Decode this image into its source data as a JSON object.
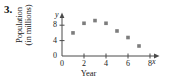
{
  "problem": {
    "number": "3."
  },
  "chart_data": {
    "type": "scatter",
    "title": "",
    "xlabel": "Year",
    "ylabel_line1": "Population",
    "ylabel_line2": "(in millions)",
    "x_axis_variable": "x",
    "y_axis_variable": "y",
    "xlim": [
      0,
      8.6
    ],
    "ylim": [
      0,
      10.4
    ],
    "xticks": [
      0,
      2,
      4,
      6,
      8
    ],
    "xtick_labels": [
      "0",
      "2",
      "4",
      "6",
      "8"
    ],
    "yticks": [
      0,
      4,
      8
    ],
    "ytick_labels": [
      "0",
      "4",
      "8"
    ],
    "grid": false,
    "legend": null,
    "marker": "square",
    "marker_color": "#7d7d7d",
    "x": [
      1,
      2,
      3,
      4,
      5,
      6,
      7
    ],
    "values": [
      6.0,
      8.5,
      9.2,
      8.5,
      6.5,
      4.8,
      2.6
    ],
    "points": [
      {
        "x": 1,
        "y": 6.0
      },
      {
        "x": 2,
        "y": 8.5
      },
      {
        "x": 3,
        "y": 9.2
      },
      {
        "x": 4,
        "y": 8.5
      },
      {
        "x": 5,
        "y": 6.5
      },
      {
        "x": 6,
        "y": 4.8
      },
      {
        "x": 7,
        "y": 2.6
      }
    ]
  },
  "colors": {
    "axis": "#4a4a4a",
    "marker": "#7d7d7d",
    "text": "#1a1a1a"
  }
}
